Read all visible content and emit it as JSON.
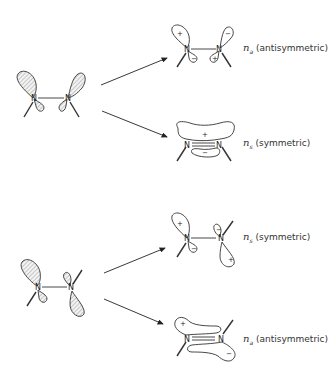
{
  "figure": {
    "atom_symbol": "N",
    "panels": [
      {
        "name": "cis",
        "reactant": "cis lone pairs (hatched)",
        "products": [
          {
            "label_sym": "n",
            "label_sub": "a",
            "label_text": "(antisymmetric)",
            "signs": [
              "+",
              "−",
              "−",
              "+"
            ]
          },
          {
            "label_sym": "n",
            "label_sub": "s",
            "label_text": "(symmetric)",
            "signs": [
              "+",
              "−"
            ]
          }
        ]
      },
      {
        "name": "trans",
        "reactant": "trans lone pairs (hatched)",
        "products": [
          {
            "label_sym": "n",
            "label_sub": "s",
            "label_text": "(symmetric)",
            "signs": [
              "+",
              "−",
              "−",
              "+"
            ]
          },
          {
            "label_sym": "n",
            "label_sub": "a",
            "label_text": "(antisymmetric)",
            "signs": [
              "+",
              "−"
            ]
          }
        ]
      }
    ]
  }
}
